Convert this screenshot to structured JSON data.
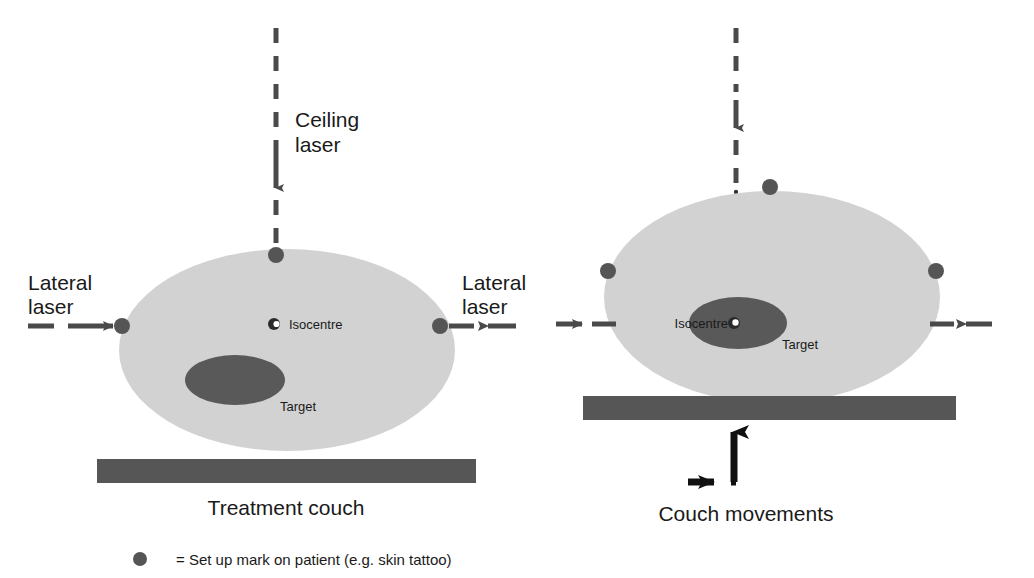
{
  "figure": {
    "title_present": false,
    "colors": {
      "body_fill": "#d2d2d2",
      "target_fill": "#595959",
      "couch_fill": "#565656",
      "mark_fill": "#555555",
      "laser_stroke": "#4a4a4a",
      "arrow_black": "#111111",
      "text": "#1a1a1a",
      "background": "#ffffff",
      "isocentre_core": "#2a2a2a",
      "isocentre_highlight": "#ffffff"
    },
    "legend": {
      "marker_name": "setup-mark-dot",
      "text": "= Set up mark on patient (e.g. skin tattoo)"
    },
    "panels": [
      {
        "id": "left",
        "name": "before-couch-shift",
        "ceiling_laser_label": "Ceiling\nlaser",
        "ceiling_laser_label_line1": "Ceiling",
        "ceiling_laser_label_line2": "laser",
        "lateral_laser_left_line1": "Lateral",
        "lateral_laser_left_line2": "laser",
        "lateral_laser_right_line1": "Lateral",
        "lateral_laser_right_line2": "laser",
        "isocentre_label": "Isocentre",
        "target_label": "Target",
        "couch_label": "Treatment couch"
      },
      {
        "id": "right",
        "name": "after-couch-shift",
        "isocentre_label": "Isocentre",
        "target_label": "Target",
        "couch_movements_label": "Couch movements"
      }
    ]
  }
}
